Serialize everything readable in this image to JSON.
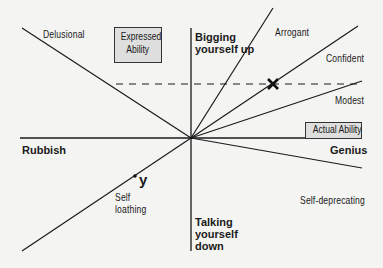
{
  "diagram": {
    "axes": {
      "x_label_box": "Actual Ability",
      "y_label_box_line1": "Expressed",
      "y_label_box_line2": "Ability",
      "x_left": "Rubbish",
      "x_right": "Genius",
      "y_top_line1": "Bigging",
      "y_top_line2": "yourself up",
      "y_bottom_line1": "Talking",
      "y_bottom_line2": "yourself",
      "y_bottom_line3": "down"
    },
    "rays": [
      {
        "label": "Delusional"
      },
      {
        "label": "Arrogant"
      },
      {
        "label": "Confident"
      },
      {
        "label": "Modest"
      },
      {
        "label": "Self-deprecating"
      },
      {
        "label_line1": "Self",
        "label_line2": "loathing"
      }
    ],
    "markers": {
      "x_marker": "×",
      "y_marker": "y"
    },
    "colors": {
      "background": "#f4f4f2",
      "line": "#1a1a1a",
      "box_fill": "#dedede"
    }
  }
}
